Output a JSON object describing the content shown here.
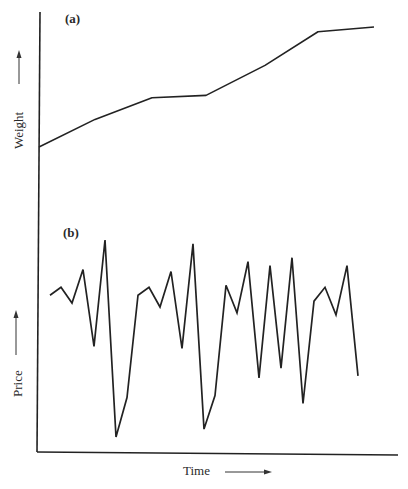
{
  "chart_data": [
    {
      "type": "line",
      "panel": "(a)",
      "title": "",
      "xlabel": "Time",
      "ylabel": "Weight",
      "grid": false,
      "legend": null,
      "ticks": false,
      "description": "Smooth, gradually increasing weight over time",
      "x": [
        0,
        1,
        2,
        3,
        4,
        5,
        6
      ],
      "values": [
        0.0,
        0.23,
        0.41,
        0.43,
        0.68,
        0.96,
        1.0
      ]
    },
    {
      "type": "line",
      "panel": "(b)",
      "title": "",
      "xlabel": "Time",
      "ylabel": "Price",
      "grid": false,
      "legend": null,
      "ticks": false,
      "description": "Highly volatile price fluctuating over time",
      "x": [
        0,
        1,
        2,
        3,
        4,
        5,
        6,
        7,
        8,
        9,
        10,
        11,
        12,
        13,
        14,
        15,
        16,
        17,
        18,
        19,
        20,
        21,
        22,
        23,
        24,
        25,
        26,
        27,
        28
      ],
      "values": [
        0.72,
        0.76,
        0.68,
        0.85,
        0.46,
        1.0,
        0.0,
        0.2,
        0.72,
        0.76,
        0.66,
        0.84,
        0.45,
        0.98,
        0.04,
        0.21,
        0.77,
        0.63,
        0.89,
        0.3,
        0.87,
        0.35,
        0.91,
        0.17,
        0.69,
        0.76,
        0.62,
        0.87,
        0.31
      ]
    }
  ],
  "labels": {
    "panel_a": "(a)",
    "panel_b": "(b)",
    "weight": "Weight",
    "price": "Price",
    "time": "Time"
  },
  "colors": {
    "line": "#222222",
    "background": "#ffffff"
  }
}
